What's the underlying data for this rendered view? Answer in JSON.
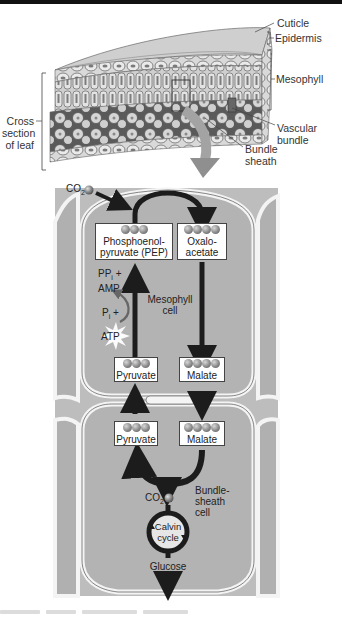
{
  "leaf_section": {
    "labels": {
      "cuticle": "Cuticle",
      "epidermis": "Epidermis",
      "mesophyll": "Mesophyll",
      "cross_section": [
        "Cross",
        "section",
        "of leaf"
      ],
      "vascular_bundle": [
        "Vascular",
        "bundle"
      ],
      "bundle_sheath": [
        "Bundle",
        "sheath"
      ]
    }
  },
  "pathway": {
    "co2_top": {
      "text": "CO",
      "sub": "2"
    },
    "pep": {
      "lines": [
        "Phosphoenol-",
        "pyruvate (PEP)"
      ],
      "carbons": 3
    },
    "oxaloacetate": {
      "lines": [
        "Oxalo-",
        "acetate"
      ],
      "carbons": 4
    },
    "ppi_amp": {
      "line1": "PP",
      "line1_sub": "i",
      "line1_tail": " +",
      "line2": "AMP"
    },
    "pi_atp": {
      "line1": "P",
      "line1_sub": "i",
      "line1_tail": " +",
      "line2": "ATP"
    },
    "mesophyll_cell": [
      "Mesophyll",
      "cell"
    ],
    "pyruvate_meso": {
      "label": "Pyruvate",
      "carbons": 3
    },
    "malate_meso": {
      "label": "Malate",
      "carbons": 4
    },
    "pyruvate_bundle": {
      "label": "Pyruvate",
      "carbons": 3
    },
    "malate_bundle": {
      "label": "Malate",
      "carbons": 4
    },
    "co2_bundle": {
      "text": "CO",
      "sub": "2"
    },
    "bundle_sheath_cell": [
      "Bundle-",
      "sheath",
      "cell"
    ],
    "calvin_cycle": [
      "Calvin",
      "cycle"
    ],
    "glucose": "Glucose"
  },
  "colors": {
    "cell_fill": "#b3b3b3",
    "cell_wall": "#f4f4f4",
    "cell_outline": "#555555",
    "arrow": "#1c1c1c",
    "big_arrow": "#9a9a9a",
    "background": "#ffffff"
  }
}
